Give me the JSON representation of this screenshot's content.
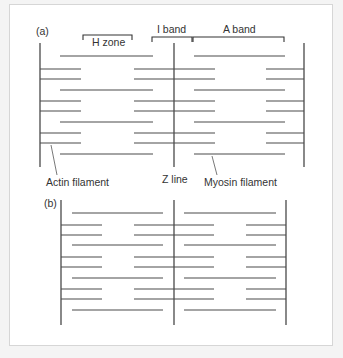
{
  "figure": {
    "panel_a_label": "(a)",
    "panel_b_label": "(b)",
    "labels": {
      "h_zone": "H zone",
      "i_band": "I band",
      "a_band": "A band",
      "actin": "Actin filament",
      "z_line": "Z line",
      "myosin": "Myosin filament"
    }
  },
  "colors": {
    "line": "#4a4a4a",
    "text": "#333333",
    "background": "#ffffff",
    "frame_border": "#d6d6d6"
  },
  "panel_a": {
    "z_lines_x": [
      40,
      174,
      304
    ],
    "z_top": 43,
    "z_bottom": 167,
    "myosin_rows_y": [
      56,
      90,
      122,
      154
    ],
    "myosin_left": [
      60,
      153
    ],
    "myosin_right": [
      194,
      285
    ],
    "actin_rows_y": [
      69,
      79,
      101,
      111,
      133,
      143
    ],
    "actin_left": [
      40,
      81
    ],
    "actin_mid": [
      134,
      215
    ],
    "actin_right": [
      266,
      304
    ]
  },
  "panel_b": {
    "z_lines_x": [
      61,
      174,
      286
    ],
    "z_top": 200,
    "z_bottom": 325,
    "myosin_rows_y": [
      213,
      245,
      278,
      310
    ],
    "myosin_left": [
      72,
      163
    ],
    "myosin_right": [
      184,
      276
    ],
    "actin_rows_y": [
      225,
      235,
      257,
      267,
      289,
      299
    ],
    "actin_left": [
      61,
      102
    ],
    "actin_mid": [
      134,
      214
    ],
    "actin_right": [
      246,
      286
    ]
  }
}
